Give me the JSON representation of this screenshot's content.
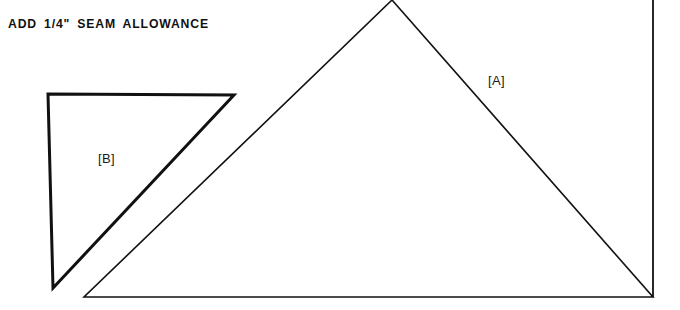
{
  "canvas": {
    "width": 680,
    "height": 310,
    "background_color": "#ffffff",
    "ink_color": "#111111"
  },
  "instruction": {
    "text": "ADD 1/4\" SEAM ALLOWANCE"
  },
  "pieces": [
    {
      "id": "A",
      "label": "[A]",
      "shape": "right-triangle",
      "stroke_width": 1.6,
      "label_position": {
        "x": 488,
        "y": 74
      },
      "points": "392,0 84,297 653,297",
      "vertices": [
        {
          "x": 392,
          "y": 0
        },
        {
          "x": 84,
          "y": 297
        },
        {
          "x": 653,
          "y": 297
        }
      ],
      "right_edge": {
        "x": 653,
        "y_top": 0,
        "y_bottom": 297
      }
    },
    {
      "id": "B",
      "label": "[B]",
      "shape": "right-triangle",
      "stroke_width": 3.0,
      "label_position": {
        "x": 98,
        "y": 152
      },
      "points": "48,94 234,95 53,288",
      "vertices": [
        {
          "x": 48,
          "y": 94
        },
        {
          "x": 234,
          "y": 95
        },
        {
          "x": 53,
          "y": 288
        }
      ]
    }
  ]
}
